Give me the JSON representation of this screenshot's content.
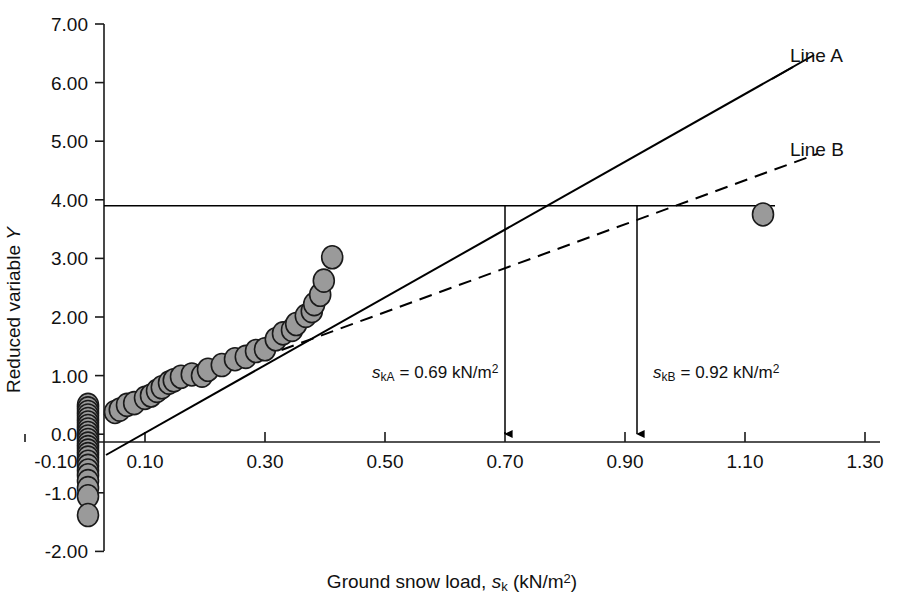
{
  "chart_data": {
    "type": "scatter",
    "title": "",
    "xlabel": "Ground snow load, s_k (kN/m2)",
    "ylabel": "Reduced variable Y",
    "xlim": [
      -0.1,
      1.3
    ],
    "ylim": [
      -2.0,
      7.0
    ],
    "grid": false,
    "legend_position": "right-inline",
    "x_tick_labels": [
      "-0.10",
      "0.10",
      "0.30",
      "0.50",
      "0.70",
      "0.90",
      "1.10",
      "1.30"
    ],
    "x_tick_values": [
      -0.1,
      0.1,
      0.3,
      0.5,
      0.7,
      0.9,
      1.1,
      1.3
    ],
    "y_tick_labels": [
      "7.00",
      "6.00",
      "5.00",
      "4.00",
      "3.00",
      "2.00",
      "1.00",
      "0.00",
      "-1.00",
      "-2.00"
    ],
    "y_tick_values": [
      7.0,
      6.0,
      5.0,
      4.0,
      3.0,
      2.0,
      1.0,
      0.0,
      -1.0,
      -2.0
    ],
    "series": [
      {
        "name": "Data points",
        "type": "scatter",
        "marker": "filled-circle",
        "marker_color": "#9a9a9a",
        "marker_edge_color": "#1a1a1a",
        "points": [
          [
            0.005,
            0.5
          ],
          [
            0.005,
            0.44
          ],
          [
            0.005,
            0.38
          ],
          [
            0.005,
            0.32
          ],
          [
            0.005,
            0.26
          ],
          [
            0.005,
            0.2
          ],
          [
            0.005,
            0.14
          ],
          [
            0.005,
            0.08
          ],
          [
            0.005,
            0.02
          ],
          [
            0.005,
            -0.04
          ],
          [
            0.005,
            -0.1
          ],
          [
            0.005,
            -0.16
          ],
          [
            0.005,
            -0.22
          ],
          [
            0.005,
            -0.28
          ],
          [
            0.005,
            -0.34
          ],
          [
            0.005,
            -0.4
          ],
          [
            0.005,
            -0.47
          ],
          [
            0.005,
            -0.54
          ],
          [
            0.005,
            -0.62
          ],
          [
            0.005,
            -0.7
          ],
          [
            0.005,
            -0.8
          ],
          [
            0.005,
            -0.92
          ],
          [
            0.005,
            -1.06
          ],
          [
            0.005,
            -1.38
          ],
          [
            0.05,
            0.38
          ],
          [
            0.058,
            0.42
          ],
          [
            0.07,
            0.5
          ],
          [
            0.082,
            0.53
          ],
          [
            0.1,
            0.62
          ],
          [
            0.11,
            0.66
          ],
          [
            0.12,
            0.74
          ],
          [
            0.128,
            0.8
          ],
          [
            0.14,
            0.88
          ],
          [
            0.148,
            0.92
          ],
          [
            0.16,
            0.98
          ],
          [
            0.178,
            1.02
          ],
          [
            0.195,
            1.0
          ],
          [
            0.205,
            1.1
          ],
          [
            0.228,
            1.18
          ],
          [
            0.25,
            1.28
          ],
          [
            0.268,
            1.32
          ],
          [
            0.285,
            1.42
          ],
          [
            0.3,
            1.45
          ],
          [
            0.318,
            1.62
          ],
          [
            0.33,
            1.72
          ],
          [
            0.345,
            1.78
          ],
          [
            0.352,
            1.88
          ],
          [
            0.368,
            2.02
          ],
          [
            0.378,
            2.1
          ],
          [
            0.382,
            2.22
          ],
          [
            0.392,
            2.38
          ],
          [
            0.398,
            2.62
          ],
          [
            0.412,
            3.02
          ],
          [
            1.13,
            3.75
          ]
        ]
      },
      {
        "name": "Line A",
        "type": "line",
        "style": "solid",
        "endpoints": [
          [
            -0.03,
            -0.22
          ],
          [
            1.18,
            6.38
          ]
        ]
      },
      {
        "name": "Line B",
        "type": "line",
        "style": "dashed",
        "endpoints": [
          [
            -0.033,
            0.33
          ],
          [
            1.185,
            4.78
          ]
        ]
      },
      {
        "name": "Design value guide",
        "type": "reference-line",
        "style": "solid",
        "y": 3.9,
        "x_from": -0.033,
        "x_to": 1.13
      }
    ],
    "annotations": [
      {
        "id": "skA",
        "text_parts": {
          "symbol": "s",
          "sub": "kA",
          "value": " = 0.69 kN/m",
          "sup": "2"
        },
        "text": "s_kA = 0.69 kN/m2",
        "x": 0.69,
        "arrow_from_y": 3.9,
        "arrow_to_y": 0.0
      },
      {
        "id": "skB",
        "text_parts": {
          "symbol": "s",
          "sub": "kB",
          "value": " = 0.92 kN/m",
          "sup": "2"
        },
        "text": "s_kB = 0.92 kN/m2",
        "x": 0.92,
        "arrow_from_y": 3.9,
        "arrow_to_y": 0.0
      }
    ],
    "line_labels": [
      {
        "id": "lineA",
        "label": "Line A"
      },
      {
        "id": "lineB",
        "label": "Line B"
      }
    ]
  },
  "axis": {
    "y_title_parts": {
      "main": "Reduced variable ",
      "italic": "Y"
    },
    "x_title_parts": {
      "main": "Ground snow load, ",
      "sym": "s",
      "sub": "k",
      "tail": " (kN/m",
      "sup": "2",
      "close": ")"
    }
  },
  "ticks": {
    "y": [
      "7.00",
      "6.00",
      "5.00",
      "4.00",
      "3.00",
      "2.00",
      "1.00",
      "0.00",
      "-1.00",
      "-2.00"
    ],
    "x": [
      "-0.10",
      "0.10",
      "0.30",
      "0.50",
      "0.70",
      "0.90",
      "1.10",
      "1.30"
    ]
  },
  "labels": {
    "line_a": "Line A",
    "line_b": "Line B",
    "annot_a_sym": "s",
    "annot_a_sub": "kA",
    "annot_a_rest": "= 0.69 kN/m",
    "annot_a_sup": "2",
    "annot_b_sym": "s",
    "annot_b_sub": "kB",
    "annot_b_rest": "= 0.92 kN/m",
    "annot_b_sup": "2",
    "y_title_main": "Reduced variable ",
    "y_title_italic": "Y",
    "x_title_main": "Ground snow load, ",
    "x_title_sym": "s",
    "x_title_sub": "k",
    "x_title_tail": " (kN/m",
    "x_title_sup": "2",
    "x_title_close": ")"
  },
  "colors": {
    "marker_fill": "#9a9a9a",
    "marker_edge": "#1a1a1a",
    "line": "#000000",
    "axis": "#1a1a1a",
    "background": "#ffffff"
  }
}
